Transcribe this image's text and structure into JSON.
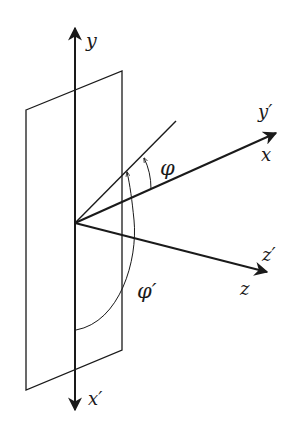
{
  "diagram": {
    "colors": {
      "stroke": "#1a1a1a",
      "background": "#ffffff"
    },
    "labels": {
      "y": "y",
      "y_prime": "y′",
      "x": "x",
      "x_prime": "x′",
      "z": "z",
      "z_prime": "z′",
      "phi": "φ",
      "phi_prime": "φ′"
    }
  }
}
